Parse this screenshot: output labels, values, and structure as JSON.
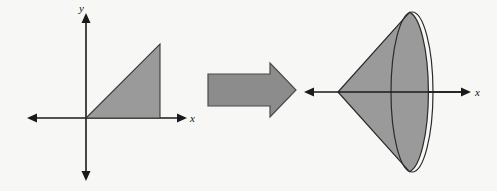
{
  "figure": {
    "title": "Revolving a triangular region about the x-axis to form a cone",
    "background_color": "#f7f7f5",
    "shape_fill_color": "#9a9a9a",
    "shape_stroke_color": "#2b2b2b",
    "axis_color": "#1a1a1a",
    "arrow_fill_color": "#8c8c8c",
    "arrow_stroke_color": "#4a4a4a"
  },
  "left_panel": {
    "name": "planar-region",
    "description": "Shaded right triangle in the first quadrant bounded by the x-axis, a slanted line through the origin, and a vertical line",
    "axes": {
      "x_label": "x",
      "y_label": "y",
      "origin": {
        "x": 86,
        "y": 118
      },
      "x_axis": {
        "start_x": 28,
        "end_x": 186,
        "y": 118,
        "arrows": "both"
      },
      "y_axis": {
        "x": 86,
        "start_y": 14,
        "end_y": 180,
        "arrows": "both"
      }
    },
    "triangle": {
      "vertices": [
        {
          "x": 86,
          "y": 118
        },
        {
          "x": 160,
          "y": 44
        },
        {
          "x": 160,
          "y": 118
        }
      ]
    }
  },
  "transition": {
    "name": "revolution-arrow",
    "symbol": "rightwards block arrow",
    "direction": "right",
    "tail": {
      "x": 208,
      "y": 82,
      "width": 62,
      "height": 16
    },
    "head": {
      "tip_x": 296,
      "top_y": 73,
      "bottom_y": 107
    }
  },
  "right_panel": {
    "name": "solid-of-revolution",
    "description": "Shaded cone generated by revolving the triangle about the x-axis, apex at the left with an elliptical base at the right",
    "axes": {
      "x_label": "x",
      "x_axis": {
        "start_x": 305,
        "end_x": 470,
        "y": 92,
        "arrows": "both"
      }
    },
    "cone": {
      "apex": {
        "x": 338,
        "y": 92
      },
      "base_ellipse": {
        "cx": 412,
        "cy": 92,
        "rx": 21,
        "ry": 80
      }
    }
  }
}
